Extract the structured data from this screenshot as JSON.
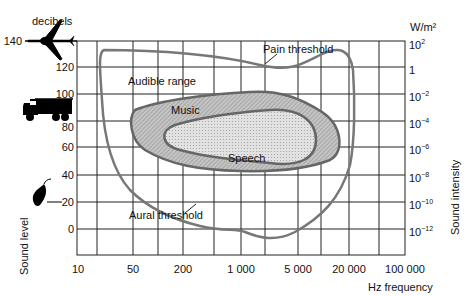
{
  "axes": {
    "y_left_unit": "decibels",
    "y_left_title": "Sound level",
    "y_left_ticks": [
      "140",
      "120",
      "100",
      "80",
      "60",
      "40",
      "20",
      "0"
    ],
    "y_right_unit": "W/m²",
    "y_right_title": "Sound intensity",
    "y_right_ticks": [
      {
        "base": "10",
        "exp": "2"
      },
      {
        "base": "1",
        "exp": ""
      },
      {
        "base": "10",
        "exp": "−2"
      },
      {
        "base": "10",
        "exp": "−4"
      },
      {
        "base": "10",
        "exp": "−6"
      },
      {
        "base": "10",
        "exp": "−8"
      },
      {
        "base": "10",
        "exp": "−10"
      },
      {
        "base": "10",
        "exp": "−12"
      }
    ],
    "x_title": "Hz frequency",
    "x_ticks": [
      "10",
      "50",
      "200",
      "1 000",
      "5 000",
      "20 000",
      "100 000"
    ]
  },
  "regions": {
    "audible": "Audible range",
    "pain": "Pain threshold",
    "music": "Music",
    "speech": "Speech",
    "aural": "Aural threshold"
  },
  "icons": {
    "airplane": "airplane-icon",
    "truck": "truck-icon",
    "leaf": "leaf-icon"
  },
  "colors": {
    "curve": "#777777",
    "music_fill": "#b9b9b9",
    "speech_fill": "#d9d9d9",
    "grid": "#222222"
  }
}
